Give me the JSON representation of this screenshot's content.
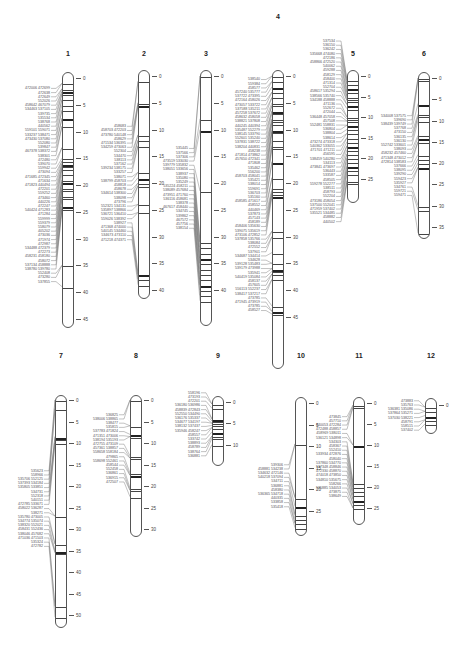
{
  "figure": {
    "type": "genetic-linkage-map",
    "units": "cM",
    "chromosomes": [
      {
        "id": "1",
        "label": "1",
        "x": 62,
        "top": 72,
        "zero_y": 78,
        "scale": 5.35,
        "length_cm": 46,
        "title_y": 50,
        "ticks": [
          0,
          5,
          10,
          15,
          20,
          25,
          30,
          35,
          40,
          45
        ],
        "bands": [
          1,
          2,
          2.5,
          3,
          4,
          5,
          6,
          7.5,
          9,
          13,
          15,
          15.5,
          16,
          16.5,
          17,
          18,
          19,
          19.5,
          20.5,
          21,
          22,
          22.5,
          24,
          24.5,
          35,
          39
        ],
        "markers": [
          "472006 472699",
          "472638",
          "472649",
          "552026",
          "458642 467079",
          "534463 537105",
          "539735",
          "535534",
          "538768",
          "440562",
          "559101 559071",
          "533237 538471",
          "473430 537080",
          "552080",
          "539847",
          "467378 538372",
          "538301",
          "472480",
          "539070",
          "559942",
          "473094",
          "471685 472345",
          "471634",
          "471823 440494",
          "472201",
          "559252",
          "473460",
          "440226",
          "472247",
          "540424 471283",
          "471284",
          "559999",
          "559379",
          "558079",
          "405202",
          "473036",
          "471974",
          "472987",
          "534488 472379",
          "472273",
          "458231 458180",
          "458072",
          "537134 458888",
          "538780 539780",
          "552408",
          "473280",
          "537855"
        ]
      },
      {
        "id": "2",
        "label": "2",
        "x": 138,
        "top": 70,
        "zero_y": 76,
        "scale": 5.35,
        "length_cm": 41,
        "title_y": 50,
        "ticks": [
          0,
          5,
          10,
          15,
          20,
          25,
          30,
          35,
          40
        ],
        "bands": [
          1,
          5,
          5.5,
          11,
          12,
          13,
          18,
          19,
          20,
          20.5,
          24,
          25.5,
          37,
          38,
          39
        ],
        "markers": [
          "458683",
          "458703 472203",
          "473780 540148",
          "458629",
          "471534 536395",
          "534259 473063",
          "552304",
          "534470",
          "538113",
          "537162",
          "539234 538175",
          "533257",
          "538071",
          "538799 458703",
          "458818",
          "458678",
          "534614 538300",
          "538098",
          "473796",
          "552321 534131",
          "535897 538866",
          "536721 536410",
          "559026 538392",
          "538927",
          "471368 474000",
          "540145 534460",
          "534673 473110",
          "471218 474371"
        ]
      },
      {
        "id": "3",
        "label": "3",
        "x": 200,
        "top": 70,
        "zero_y": 76,
        "scale": 5.35,
        "length_cm": 46,
        "title_y": 50,
        "ticks": [
          0,
          5,
          10,
          15,
          20,
          25,
          30,
          35,
          40
        ],
        "bands": [
          0,
          8,
          10,
          21.5,
          31,
          32,
          33,
          34,
          35,
          36,
          37,
          38,
          39,
          40,
          41,
          42
        ],
        "markers": [
          "535445",
          "537566",
          "537306",
          "473519 533030",
          "539779 535832",
          "538051 533656",
          "538937",
          "535080",
          "535249",
          "535224 458211",
          "538089 457684",
          "473951 471760",
          "536116 458681",
          "538378",
          "467617 458440",
          "534745",
          "539862",
          "467572",
          "457756",
          "538154"
        ]
      },
      {
        "id": "4",
        "label": "4",
        "x": 272,
        "top": 70,
        "zero_y": 76,
        "scale": 5.35,
        "length_cm": 54,
        "title_y": 13,
        "ticks": [
          0,
          5,
          10,
          15,
          20,
          25,
          30,
          35,
          40,
          45
        ],
        "bands": [
          0,
          1,
          2,
          3,
          4,
          5,
          5.5,
          6.5,
          7,
          8,
          8.5,
          9,
          10,
          10.5,
          12,
          13,
          13.5,
          16,
          19,
          21,
          21.5,
          22,
          22.5,
          29,
          30,
          33,
          35,
          36,
          36.5,
          37,
          38,
          43,
          44,
          44.5
        ],
        "markers": [
          "538540",
          "559384",
          "458577",
          "457240 535777",
          "537722 473395",
          "472164 458026",
          "473057 533722",
          "537588 535211",
          "457258 537672",
          "458632 458058",
          "538821 537808",
          "440245 440394",
          "535487 552279",
          "538145 533790",
          "552601 535240",
          "537831 538722",
          "538204 440831",
          "458238",
          "471814 473862",
          "457650 472341",
          "471808",
          "535462",
          "556200",
          "458703 458041",
          "535421",
          "538014",
          "559691",
          "536703",
          "535160",
          "458585 471617",
          "458552",
          "440469",
          "537873",
          "457143",
          "458189",
          "458406 535630",
          "539075 535619",
          "473106 472852",
          "537858 535766",
          "538084",
          "472552",
          "537901",
          "534687 534414",
          "534628",
          "539128 535483",
          "539179 473988",
          "535941",
          "540419 535084",
          "458137",
          "457605",
          "556113 552237",
          "538417 537217",
          "473785",
          "471945 473919",
          "473785",
          "458527"
        ]
      },
      {
        "id": "5",
        "label": "5",
        "x": 347,
        "top": 70,
        "zero_y": 76,
        "scale": 4.1,
        "length_cm": 30,
        "title_y": 50,
        "ticks": [
          0,
          5,
          10,
          15,
          20,
          25
        ],
        "bands": [
          1,
          2,
          3,
          4,
          5,
          5.5,
          6,
          7,
          8,
          10,
          10.5,
          11,
          12,
          13,
          14,
          15,
          16,
          17,
          18,
          19,
          20,
          21,
          22,
          23,
          24,
          25.5,
          26
        ],
        "markers": [
          "537534",
          "536150",
          "536242",
          "535668 474080",
          "472186",
          "458866 472520",
          "540062",
          "459288",
          "458129",
          "458400",
          "471314",
          "552704",
          "458617 535294",
          "538566 535740",
          "534188 458888",
          "471136",
          "552672",
          "472044",
          "536448 457058",
          "457508",
          "552481 558831",
          "536804",
          "538804",
          "538614",
          "473274 473318",
          "540362 533055",
          "471701 471211",
          "456595",
          "538459 540280",
          "534113",
          "473841 473697",
          "536443",
          "533587",
          "458505",
          "559278 552277",
          "538511",
          "458793",
          "552204",
          "473186 458054",
          "537500 552041",
          "471959 537402",
          "535521 534485",
          "458882",
          "440502"
        ]
      },
      {
        "id": "6",
        "label": "6",
        "x": 418,
        "top": 72,
        "zero_y": 78,
        "scale": 4.25,
        "length_cm": 37,
        "title_y": 50,
        "ticks": [
          0,
          5,
          10,
          15,
          20,
          25,
          30,
          35
        ],
        "bands": [
          0,
          0.5,
          6,
          8.5,
          9,
          10,
          13.5,
          14,
          15,
          18,
          19,
          20,
          21,
          30,
          31,
          36.5
        ],
        "markers": [
          "534008 537575",
          "539690",
          "538439 539749",
          "537768",
          "473150",
          "536135",
          "536130",
          "552742 533601",
          "538093",
          "458232 457460",
          "471348 473012",
          "472814 538583",
          "537666",
          "538095",
          "539290",
          "559423",
          "535927",
          "534761",
          "559721",
          "559471"
        ]
      },
      {
        "id": "7",
        "label": "7",
        "x": 55,
        "top": 395,
        "zero_y": 400,
        "scale": 4.3,
        "length_cm": 52,
        "title_y": 352,
        "ticks": [
          0,
          5,
          10,
          15,
          20,
          25,
          30,
          35,
          40,
          45,
          50
        ],
        "bands": [
          0,
          2,
          8.5,
          9,
          10,
          27,
          33.5,
          35,
          35.5,
          48,
          50.5
        ],
        "markers": [
          "535623",
          "558966",
          "535706 552125",
          "537393 534184",
          "535805 533851",
          "534731",
          "552318",
          "540151",
          "472785 533671",
          "458022 536287",
          "538271",
          "535780 473005",
          "534774 535074",
          "538320 552021",
          "458431 552436",
          "538046 457682",
          "471036 471503",
          "535324",
          "472782"
        ]
      },
      {
        "id": "8",
        "label": "8",
        "x": 130,
        "top": 395,
        "zero_y": 400,
        "scale": 4.3,
        "length_cm": 31,
        "title_y": 352,
        "ticks": [
          0,
          5,
          10,
          15,
          20,
          25,
          30
        ],
        "bands": [
          0,
          6,
          8,
          8.5,
          13,
          13.5,
          17,
          17.5,
          20.5,
          21,
          22.5
        ],
        "markers": [
          "536825",
          "538006 538865",
          "538477",
          "535815",
          "537783 471824",
          "471351 473006",
          "538194 535193",
          "472755 473109",
          "457361 538857",
          "558658 558184",
          "479865",
          "558698 552461",
          "458544",
          "552458",
          "536861",
          "536915",
          "472507"
        ]
      },
      {
        "id": "9",
        "label": "9",
        "x": 212,
        "top": 396,
        "zero_y": 402,
        "scale": 4.25,
        "length_cm": 14,
        "title_y": 352,
        "ticks": [
          0,
          5,
          10
        ],
        "bands": [
          0.5,
          1.5,
          4,
          4.5,
          5,
          5.5,
          6,
          7,
          8,
          8.5,
          10
        ],
        "markers": [
          "558196",
          "473193",
          "472201",
          "536180 536986",
          "458839 472843",
          "552550 534490",
          "536176 535337",
          "534677 534197",
          "538132 537437",
          "535946 458247",
          "458557",
          "533742",
          "538893",
          "458789",
          "538764",
          "536881"
        ]
      },
      {
        "id": "10",
        "label": "10",
        "x": 295,
        "top": 397,
        "zero_y": 403,
        "scale": 4.3,
        "length_cm": 30,
        "title_y": 352,
        "ticks": [
          0,
          5,
          10,
          15,
          20,
          25
        ],
        "bands": [
          9.5,
          22,
          24,
          26,
          27,
          28,
          29
        ],
        "markers": [
          "539306",
          "458881 534238",
          "534632 472146",
          "540218 537094",
          "534711",
          "536881",
          "458380",
          "536365 534718",
          "440335",
          "533858",
          "535418"
        ]
      },
      {
        "id": "11",
        "label": "11",
        "x": 353,
        "top": 397,
        "zero_y": 403,
        "scale": 4.2,
        "length_cm": 28,
        "title_y": 352,
        "ticks": [
          0,
          5,
          10,
          15,
          20,
          25
        ],
        "bands": [
          0.5,
          1,
          10,
          19,
          20,
          21,
          22,
          23,
          24,
          25
        ],
        "markers": [
          "473845",
          "457710",
          "440053 472284",
          "472488 458857",
          "458969 538011",
          "536121 534898",
          "534303",
          "458367",
          "552410",
          "533934 472876",
          "458040",
          "537860 534770",
          "537348 458846",
          "472330 458870",
          "474018 473850",
          "534810 535675",
          "558266",
          "535885 534053",
          "473875",
          "538649"
        ]
      },
      {
        "id": "12",
        "label": "12",
        "x": 425,
        "top": 398,
        "zero_y": 405,
        "scale": 4.2,
        "length_cm": 6,
        "title_y": 352,
        "ticks": [
          0
        ],
        "bands": [
          0.5,
          1.5,
          2.5,
          3.5,
          4.5
        ],
        "markers": [
          "473883",
          "535763",
          "536381 535086",
          "537864 535271",
          "537030 538221",
          "458791",
          "558515",
          "537402"
        ]
      }
    ]
  }
}
